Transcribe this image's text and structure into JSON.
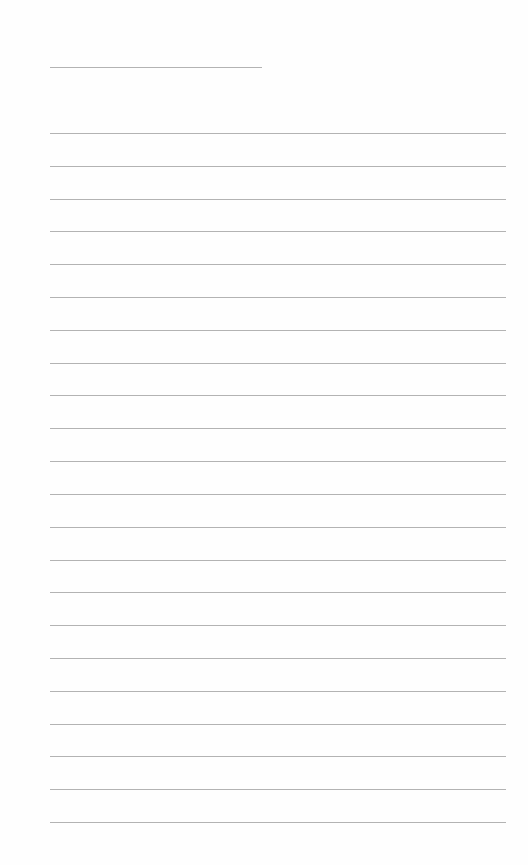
{
  "document": {
    "type": "ruled-notebook-page",
    "paper_color": "#ffffff",
    "line_color": "#a6a6a6",
    "header_line": {
      "present": true
    },
    "body_line_count": 22,
    "text_content": ""
  }
}
